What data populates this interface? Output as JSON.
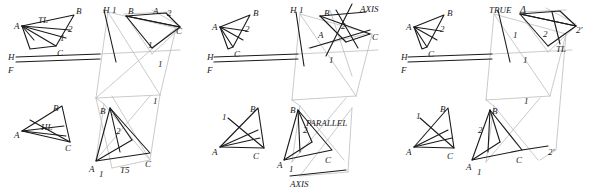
{
  "figure": {
    "width": 596,
    "height": 189,
    "ink_color": "#1a1a1a",
    "faint_color": "#b9b9b9"
  },
  "panels": [
    {
      "id": "panel-1-top",
      "name": "true-length-construction",
      "labels": [
        {
          "text": "TL",
          "x": 38,
          "y": 16,
          "size": 9
        },
        {
          "text": "B",
          "x": 76,
          "y": 7,
          "size": 9
        },
        {
          "text": "H",
          "x": 103,
          "y": 6,
          "size": 9
        },
        {
          "text": "1",
          "x": 112,
          "y": 6,
          "size": 9
        },
        {
          "text": "B",
          "x": 128,
          "y": 7,
          "size": 9
        },
        {
          "text": "A",
          "x": 153,
          "y": 7,
          "size": 9
        },
        {
          "text": "2",
          "x": 167,
          "y": 9,
          "size": 9
        },
        {
          "text": "A",
          "x": 14,
          "y": 22,
          "size": 9
        },
        {
          "text": "2",
          "x": 68,
          "y": 25,
          "size": 9
        },
        {
          "text": "1",
          "x": 60,
          "y": 34,
          "size": 9
        },
        {
          "text": "C",
          "x": 176,
          "y": 27,
          "size": 9
        },
        {
          "text": "C",
          "x": 57,
          "y": 49,
          "size": 9
        },
        {
          "text": "1",
          "x": 148,
          "y": 41,
          "size": 9
        },
        {
          "text": "H",
          "x": 8,
          "y": 53,
          "size": 9
        },
        {
          "text": "F",
          "x": 8,
          "y": 66,
          "size": 9
        },
        {
          "text": "1",
          "x": 158,
          "y": 60,
          "size": 9
        }
      ]
    },
    {
      "id": "panel-1-bottom",
      "name": "true-shape-construction",
      "labels": [
        {
          "text": "B",
          "x": 53,
          "y": 104,
          "size": 9
        },
        {
          "text": "HL",
          "x": 41,
          "y": 123,
          "size": 9
        },
        {
          "text": "A",
          "x": 14,
          "y": 131,
          "size": 9
        },
        {
          "text": "C",
          "x": 65,
          "y": 144,
          "size": 9
        },
        {
          "text": "B",
          "x": 100,
          "y": 107,
          "size": 9
        },
        {
          "text": "2",
          "x": 116,
          "y": 127,
          "size": 9
        },
        {
          "text": "A",
          "x": 89,
          "y": 165,
          "size": 9
        },
        {
          "text": "1",
          "x": 99,
          "y": 170,
          "size": 9
        },
        {
          "text": "T5",
          "x": 120,
          "y": 166,
          "size": 9
        },
        {
          "text": "C",
          "x": 145,
          "y": 160,
          "size": 9
        },
        {
          "text": "1",
          "x": 153,
          "y": 97,
          "size": 9
        }
      ]
    },
    {
      "id": "panel-2-top",
      "name": "edge-view-axis-construction",
      "labels": [
        {
          "text": "B",
          "x": 253,
          "y": 9,
          "size": 9
        },
        {
          "text": "H",
          "x": 290,
          "y": 6,
          "size": 9
        },
        {
          "text": "1",
          "x": 299,
          "y": 6,
          "size": 9
        },
        {
          "text": "AXIS",
          "x": 360,
          "y": 5,
          "size": 9
        },
        {
          "text": "B",
          "x": 324,
          "y": 9,
          "size": 9
        },
        {
          "text": "A",
          "x": 212,
          "y": 23,
          "size": 9
        },
        {
          "text": "2",
          "x": 245,
          "y": 25,
          "size": 9
        },
        {
          "text": "2",
          "x": 341,
          "y": 22,
          "size": 9
        },
        {
          "text": "A",
          "x": 318,
          "y": 31,
          "size": 9
        },
        {
          "text": "C",
          "x": 372,
          "y": 33,
          "size": 9
        },
        {
          "text": "H",
          "x": 207,
          "y": 53,
          "size": 9
        },
        {
          "text": "C",
          "x": 234,
          "y": 50,
          "size": 9
        },
        {
          "text": "F",
          "x": 207,
          "y": 66,
          "size": 9
        },
        {
          "text": "1",
          "x": 329,
          "y": 56,
          "size": 9
        }
      ]
    },
    {
      "id": "panel-2-bottom",
      "name": "parallel-axis-construction",
      "labels": [
        {
          "text": "B",
          "x": 290,
          "y": 106,
          "size": 9
        },
        {
          "text": "1",
          "x": 222,
          "y": 113,
          "size": 9
        },
        {
          "text": "B",
          "x": 250,
          "y": 105,
          "size": 9
        },
        {
          "text": "2",
          "x": 303,
          "y": 126,
          "size": 9
        },
        {
          "text": "PARALLEL",
          "x": 306,
          "y": 119,
          "size": 9
        },
        {
          "text": "A",
          "x": 212,
          "y": 148,
          "size": 9
        },
        {
          "text": "C",
          "x": 253,
          "y": 152,
          "size": 9
        },
        {
          "text": "A",
          "x": 277,
          "y": 161,
          "size": 9
        },
        {
          "text": "1",
          "x": 289,
          "y": 165,
          "size": 9
        },
        {
          "text": "C",
          "x": 325,
          "y": 156,
          "size": 9
        },
        {
          "text": "AXIS",
          "x": 290,
          "y": 180,
          "size": 9
        }
      ]
    },
    {
      "id": "panel-3-top",
      "name": "true-angle-construction",
      "labels": [
        {
          "text": "TRUE",
          "x": 489,
          "y": 6,
          "size": 9
        },
        {
          "text": "Δ",
          "x": 520,
          "y": 5,
          "size": 10
        },
        {
          "text": "B",
          "x": 447,
          "y": 9,
          "size": 9
        },
        {
          "text": "A",
          "x": 406,
          "y": 23,
          "size": 9
        },
        {
          "text": "2",
          "x": 440,
          "y": 25,
          "size": 9
        },
        {
          "text": "1",
          "x": 513,
          "y": 31,
          "size": 9
        },
        {
          "text": "2",
          "x": 543,
          "y": 30,
          "size": 9
        },
        {
          "text": "2'",
          "x": 576,
          "y": 26,
          "size": 9
        },
        {
          "text": "TL",
          "x": 556,
          "y": 45,
          "size": 9
        },
        {
          "text": "H",
          "x": 401,
          "y": 53,
          "size": 9
        },
        {
          "text": "C",
          "x": 428,
          "y": 50,
          "size": 9
        },
        {
          "text": "F",
          "x": 401,
          "y": 66,
          "size": 9
        },
        {
          "text": "1",
          "x": 523,
          "y": 56,
          "size": 9
        }
      ]
    },
    {
      "id": "panel-3-bottom",
      "name": "final-true-shape",
      "labels": [
        {
          "text": "B",
          "x": 440,
          "y": 105,
          "size": 9
        },
        {
          "text": "1",
          "x": 416,
          "y": 112,
          "size": 9
        },
        {
          "text": "2",
          "x": 478,
          "y": 126,
          "size": 9
        },
        {
          "text": "B",
          "x": 492,
          "y": 107,
          "size": 9
        },
        {
          "text": "A",
          "x": 406,
          "y": 148,
          "size": 9
        },
        {
          "text": "C",
          "x": 447,
          "y": 152,
          "size": 9
        },
        {
          "text": "A",
          "x": 466,
          "y": 163,
          "size": 9
        },
        {
          "text": "1",
          "x": 477,
          "y": 168,
          "size": 9
        },
        {
          "text": "C",
          "x": 516,
          "y": 156,
          "size": 9
        },
        {
          "text": "2'",
          "x": 548,
          "y": 148,
          "size": 9
        },
        {
          "text": "1",
          "x": 524,
          "y": 97,
          "size": 9
        }
      ]
    }
  ],
  "strokes": {
    "dark": [
      {
        "name": "p1-top-triangle-AB",
        "pts": "22,26 74,14"
      },
      {
        "name": "p1-top-triangle-BC",
        "pts": "74,14 56,46"
      },
      {
        "name": "p1-top-triangle-CA",
        "pts": "56,46 22,26"
      },
      {
        "name": "p1-top-median-A2",
        "pts": "22,26 70,31"
      },
      {
        "name": "p1-top-median-1",
        "pts": "22,26 66,39"
      },
      {
        "name": "p1-top-A-spur",
        "pts": "22,26 30,49"
      },
      {
        "name": "p1-top-A-spur2",
        "pts": "30,49 56,46"
      },
      {
        "name": "p1-top-HF-line",
        "pts": "16,57 100,54"
      },
      {
        "name": "p1-top-HF-line2",
        "pts": "16,62 100,59"
      },
      {
        "name": "p2-tri-AB",
        "pts": "220,27 250,15"
      },
      {
        "name": "p2-tri-BC",
        "pts": "250,15 233,47"
      },
      {
        "name": "p2-tri-CA",
        "pts": "233,47 220,27"
      },
      {
        "name": "p2-tri-A2",
        "pts": "220,27 247,31"
      },
      {
        "name": "p2-tri-A1",
        "pts": "220,27 243,40"
      },
      {
        "name": "p2-HF",
        "pts": "214,57 298,54"
      },
      {
        "name": "p2-HF2",
        "pts": "214,62 298,59"
      },
      {
        "name": "p3-tri-AB",
        "pts": "414,27 444,15"
      },
      {
        "name": "p3-tri-BC",
        "pts": "444,15 427,47"
      },
      {
        "name": "p3-tri-CA",
        "pts": "427,47 414,27"
      },
      {
        "name": "p3-tri-A2",
        "pts": "414,27 441,31"
      },
      {
        "name": "p3-tri-A1",
        "pts": "414,27 437,40"
      },
      {
        "name": "p3-HF",
        "pts": "408,57 492,54"
      },
      {
        "name": "p3-HF2",
        "pts": "408,62 492,59"
      }
    ]
  }
}
